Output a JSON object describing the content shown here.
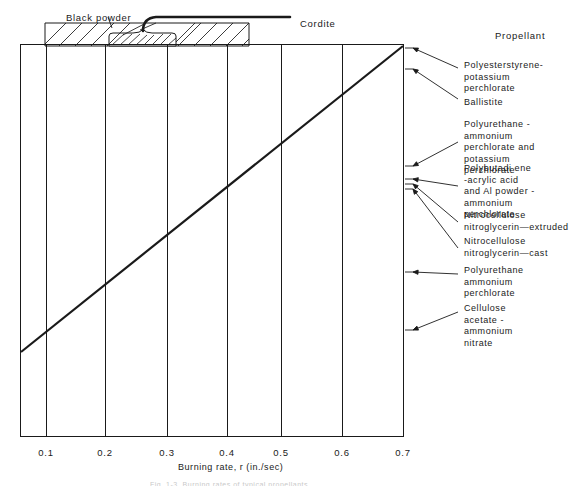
{
  "figure": {
    "top_labels": [
      {
        "text": "Black powder",
        "x": 66,
        "y": 12
      },
      {
        "text": "Cordite",
        "x": 300,
        "y": 18
      }
    ],
    "column_header": {
      "text": "Propellant",
      "x": 495,
      "y": 30
    },
    "axis": {
      "title": "Burning rate, r (in./sec)",
      "title_x": 178,
      "title_y": 466,
      "tick_labels": [
        "0.1",
        "0.2",
        "0.3",
        "0.4",
        "0.5",
        "0.6",
        "0.7"
      ],
      "tick_positions_px": [
        46,
        105,
        167,
        227,
        281,
        342,
        403
      ],
      "tick_label_y": 447,
      "tick_values": [
        0.1,
        0.2,
        0.3,
        0.4,
        0.5,
        0.6,
        0.7
      ]
    },
    "callouts": [
      {
        "lines": [
          "Polyesterstyrene-",
          "potassium",
          "perchlorate"
        ],
        "text_x": 464,
        "text_y": 60,
        "anchor_x": 405,
        "anchor_y": 48,
        "leader_to_x": 458,
        "leader_to_y": 68
      },
      {
        "lines": [
          "Ballistite"
        ],
        "text_x": 464,
        "text_y": 97,
        "anchor_x": 405,
        "anchor_y": 69,
        "leader_to_x": 458,
        "leader_to_y": 99
      },
      {
        "lines": [
          "Polyurethane -",
          "ammonium",
          "perchlorate and",
          "potassium",
          "perchlorate"
        ],
        "text_x": 464,
        "text_y": 119,
        "anchor_x": 405,
        "anchor_y": 166,
        "leader_to_x": 458,
        "leader_to_y": 142
      },
      {
        "lines": [
          "Polybutadi ene",
          "-acrylic acid",
          "and Al powder -",
          "ammonium",
          "perchlorate"
        ],
        "text_x": 464,
        "text_y": 163,
        "anchor_x": 405,
        "anchor_y": 179,
        "leader_to_x": 458,
        "leader_to_y": 186
      },
      {
        "lines": [
          "Nitrocellulose",
          "nitroglycerin—extruded"
        ],
        "text_x": 464,
        "text_y": 210,
        "anchor_x": 405,
        "anchor_y": 184,
        "leader_to_x": 458,
        "leader_to_y": 222
      },
      {
        "lines": [
          "Nitrocellulose",
          "nitroglycerin—cast"
        ],
        "text_x": 464,
        "text_y": 236,
        "anchor_x": 405,
        "anchor_y": 189,
        "leader_to_x": 458,
        "leader_to_y": 248
      },
      {
        "lines": [
          "Polyurethane",
          "ammonium",
          "perchlorate"
        ],
        "text_x": 464,
        "text_y": 265,
        "anchor_x": 405,
        "anchor_y": 272,
        "leader_to_x": 458,
        "leader_to_y": 274
      },
      {
        "lines": [
          "Cellulose",
          "acetate -",
          "ammonium",
          "nitrate"
        ],
        "text_x": 464,
        "text_y": 303,
        "anchor_x": 405,
        "anchor_y": 330,
        "leader_to_x": 458,
        "leader_to_y": 312
      }
    ],
    "caption_fragment": "Fig. 1-3. Burning rates of typical propellants"
  },
  "chart_data": {
    "type": "line",
    "title": "",
    "xlabel": "Burning rate, r (in./sec)",
    "ylabel": "Propellant",
    "xlim": [
      0.0,
      0.7
    ],
    "grid": true,
    "legend": "none",
    "xticks": [
      0.1,
      0.2,
      0.3,
      0.4,
      0.5,
      0.6,
      0.7
    ],
    "categories": [
      "Polyesterstyrene-potassium perchlorate",
      "Ballistite",
      "Polyurethane - ammonium perchlorate and potassium perchlorate",
      "Polybutadiene-acrylic acid and Al powder - ammonium perchlorate",
      "Nitrocellulose nitroglycerin—extruded",
      "Nitrocellulose nitroglycerin—cast",
      "Polyurethane ammonium perchlorate",
      "Cellulose acetate - ammonium nitrate"
    ],
    "values": [
      0.7,
      0.67,
      0.5,
      0.48,
      0.47,
      0.46,
      0.34,
      0.25
    ],
    "series": [
      {
        "name": "Burning rate ranking line",
        "points": [
          {
            "x": 0.04,
            "y": 0.25
          },
          {
            "x": 0.7,
            "y": 0.7
          }
        ]
      }
    ],
    "annotations": [
      "Black powder",
      "Cordite"
    ]
  }
}
